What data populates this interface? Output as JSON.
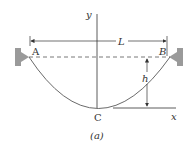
{
  "figure": {
    "caption": "(a)",
    "labels": {
      "y_axis": "y",
      "x_axis": "x",
      "span": "L",
      "point_a": "A",
      "point_b": "B",
      "point_c": "C",
      "sag": "h"
    },
    "colors": {
      "cable": "#6a6a6a",
      "axis": "#333333",
      "support": "#9a9a9a",
      "dashed": "#555555"
    }
  }
}
